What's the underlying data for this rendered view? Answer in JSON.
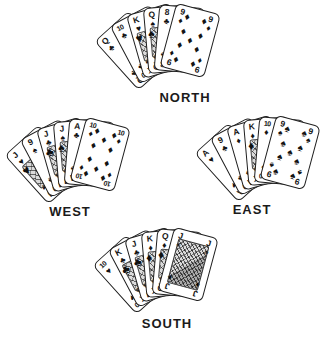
{
  "page": {
    "background": "#ffffff",
    "ink": "#1b1b1b",
    "card_bg": "#ffffff"
  },
  "suit_symbols": {
    "spade": "♠",
    "heart": "♥",
    "diamond": "♦",
    "club": "♣"
  },
  "hands": {
    "north": {
      "label": "NORTH",
      "cards": [
        {
          "rank": "Q",
          "suit": "club",
          "court": false,
          "full": false
        },
        {
          "rank": "10",
          "suit": "club",
          "court": false,
          "full": false
        },
        {
          "rank": "K",
          "suit": "heart",
          "court": true,
          "full": false
        },
        {
          "rank": "Q",
          "suit": "spade",
          "court": true,
          "full": false
        },
        {
          "rank": "8",
          "suit": "club",
          "court": false,
          "full": false
        },
        {
          "rank": "9",
          "suit": "diamond",
          "court": false,
          "full": true
        }
      ]
    },
    "west": {
      "label": "WEST",
      "cards": [
        {
          "rank": "J",
          "suit": "heart",
          "court": true,
          "full": false
        },
        {
          "rank": "9",
          "suit": "spade",
          "court": false,
          "full": false
        },
        {
          "rank": "J",
          "suit": "club",
          "court": true,
          "full": false
        },
        {
          "rank": "J",
          "suit": "spade",
          "court": true,
          "full": false
        },
        {
          "rank": "A",
          "suit": "club",
          "court": false,
          "full": false
        },
        {
          "rank": "10",
          "suit": "diamond",
          "court": false,
          "full": true
        }
      ]
    },
    "east": {
      "label": "EAST",
      "cards": [
        {
          "rank": "A",
          "suit": "heart",
          "court": false,
          "full": false
        },
        {
          "rank": "9",
          "suit": "club",
          "court": false,
          "full": false
        },
        {
          "rank": "A",
          "suit": "diamond",
          "court": false,
          "full": false
        },
        {
          "rank": "K",
          "suit": "diamond",
          "court": true,
          "full": false
        },
        {
          "rank": "10",
          "suit": "diamond",
          "court": false,
          "full": false
        },
        {
          "rank": "9",
          "suit": "spade",
          "court": false,
          "full": true
        }
      ]
    },
    "south": {
      "label": "SOUTH",
      "cards": [
        {
          "rank": "10",
          "suit": "heart",
          "court": false,
          "full": false
        },
        {
          "rank": "K",
          "suit": "club",
          "court": true,
          "full": false
        },
        {
          "rank": "J",
          "suit": "club",
          "court": true,
          "full": false
        },
        {
          "rank": "K",
          "suit": "diamond",
          "court": true,
          "full": false
        },
        {
          "rank": "Q",
          "suit": "diamond",
          "court": true,
          "full": false
        },
        {
          "rank": "J",
          "suit": "diamond",
          "court": true,
          "full": true
        }
      ]
    }
  }
}
